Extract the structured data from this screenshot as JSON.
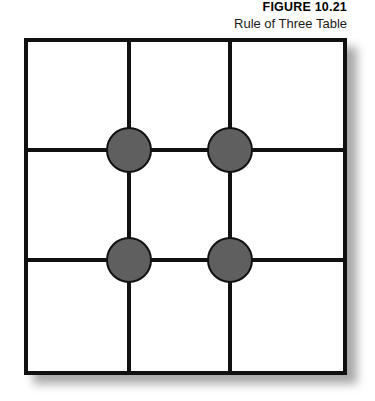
{
  "caption": {
    "figure_number": "FIGURE 10.21",
    "figure_title": "Rule of Three Table"
  },
  "colors": {
    "page_background": "#ffffff",
    "line": "#111111",
    "node_fill": "#5f5f5f",
    "node_stroke": "#111111",
    "shadow": "#9a9a9a",
    "text": "#000000"
  },
  "chart_data": {
    "type": "diagram",
    "title": "Rule of Three Table",
    "subtitle": "FIGURE 10.21",
    "grid": {
      "columns": 3,
      "rows": 3,
      "vertical_dividers": 2,
      "horizontal_dividers": 2,
      "outer_border": true
    },
    "nodes": [
      {
        "id": "node-r1c1",
        "row": 1,
        "column": 1,
        "label": "",
        "shape": "circle",
        "fill": "#5f5f5f"
      },
      {
        "id": "node-r1c2",
        "row": 1,
        "column": 2,
        "label": "",
        "shape": "circle",
        "fill": "#5f5f5f"
      },
      {
        "id": "node-r2c1",
        "row": 2,
        "column": 1,
        "label": "",
        "shape": "circle",
        "fill": "#5f5f5f"
      },
      {
        "id": "node-r2c2",
        "row": 2,
        "column": 2,
        "label": "",
        "shape": "circle",
        "fill": "#5f5f5f"
      }
    ],
    "node_count": 4,
    "legend": [],
    "annotations": []
  }
}
